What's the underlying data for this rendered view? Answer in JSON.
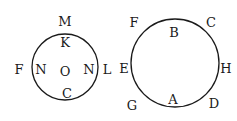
{
  "diagram": {
    "left_circle": {
      "center": [
        65,
        67
      ],
      "radius": 33,
      "labels": {
        "top_outside": "M",
        "top_inside": "K",
        "left_outside": "F",
        "left_inside": "N",
        "center": "O",
        "right_inside": "N",
        "right_outside": "L",
        "bottom_inside": "C"
      }
    },
    "right_circle": {
      "center": [
        175,
        63
      ],
      "radius": 44,
      "labels": {
        "top_inside": "B",
        "top_left_outside": "F",
        "top_right_outside": "C",
        "left_outside": "E",
        "right_outside": "H",
        "bottom_inside": "A",
        "bottom_left_outside": "G",
        "bottom_right_outside": "D"
      }
    },
    "stroke_color": "#1a1a1a",
    "background": "#ffffff"
  }
}
